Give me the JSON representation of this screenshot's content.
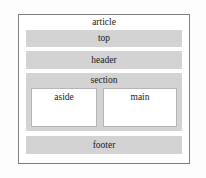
{
  "diagram": {
    "kind": "html-semantic-layout-diagram",
    "colors": {
      "page_background": "#fdfdfd",
      "outer_border": "#808080",
      "band_fill": "#d3d3d3",
      "inner_box_fill": "#ffffff",
      "inner_box_border": "#b5b5b5",
      "text": "#1a1a1a"
    },
    "article": {
      "label": "article",
      "bands": [
        {
          "name": "top",
          "label": "top"
        },
        {
          "name": "header",
          "label": "header"
        },
        {
          "name": "section",
          "label": "section"
        },
        {
          "name": "footer",
          "label": "footer"
        }
      ],
      "section_children": [
        {
          "name": "aside",
          "label": "aside"
        },
        {
          "name": "main",
          "label": "main"
        }
      ]
    }
  }
}
